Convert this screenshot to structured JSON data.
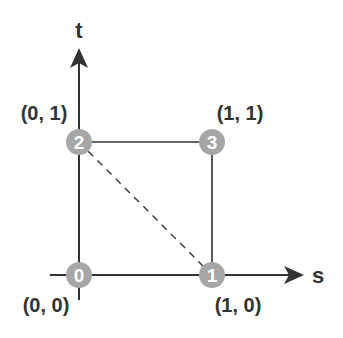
{
  "diagram": {
    "axes": {
      "vertical_label": "t",
      "horizontal_label": "s"
    },
    "nodes": [
      {
        "id": "0",
        "coord_label": "(0, 0)"
      },
      {
        "id": "1",
        "coord_label": "(1, 0)"
      },
      {
        "id": "2",
        "coord_label": "(0, 1)"
      },
      {
        "id": "3",
        "coord_label": "(1, 1)"
      }
    ],
    "edges": [
      {
        "from": "0",
        "to": "1",
        "style": "solid"
      },
      {
        "from": "1",
        "to": "3",
        "style": "solid"
      },
      {
        "from": "3",
        "to": "2",
        "style": "solid"
      },
      {
        "from": "2",
        "to": "0",
        "style": "solid"
      },
      {
        "from": "2",
        "to": "1",
        "style": "dashed"
      }
    ],
    "colors": {
      "line": "#333333",
      "node_fill": "#a6a6a6",
      "node_text": "#ffffff",
      "label": "#333333"
    }
  }
}
